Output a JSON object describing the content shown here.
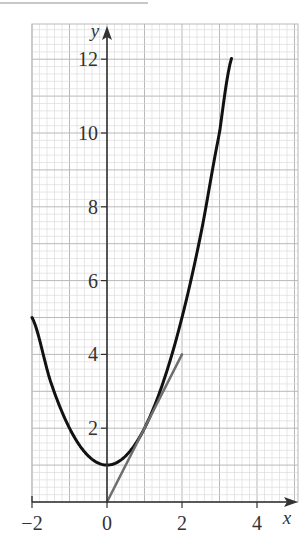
{
  "chart_data": {
    "type": "line",
    "title": "",
    "xlabel": "x",
    "ylabel": "y",
    "xlim": [
      -2,
      5.1
    ],
    "ylim": [
      0,
      12.95
    ],
    "grid": true,
    "grid_minor_step": 0.2,
    "grid_major_step": 1,
    "x_ticks": [
      -2,
      0,
      2,
      4
    ],
    "x_tick_labels": [
      "−2",
      "0",
      "2",
      "4"
    ],
    "y_ticks": [
      2,
      4,
      6,
      8,
      10,
      12
    ],
    "y_tick_labels": [
      "2",
      "4",
      "6",
      "8",
      "10",
      "12"
    ],
    "series": [
      {
        "name": "curve y = x^2 + 1",
        "color": "#111111",
        "width": 3,
        "x": [
          -2,
          -1.5,
          -1,
          -0.5,
          0,
          0.5,
          1,
          1.5,
          2,
          2.5,
          3,
          3.32
        ],
        "y": [
          5,
          3.25,
          2,
          1.25,
          1,
          1.25,
          2,
          3.25,
          5,
          7.25,
          10,
          12.02
        ]
      },
      {
        "name": "tangent line y = 2x (at x = 1)",
        "color": "#6e6e6e",
        "width": 2.5,
        "x": [
          0,
          2
        ],
        "y": [
          0,
          4
        ]
      }
    ]
  },
  "layout": {
    "origin_px": [
      107,
      502
    ],
    "scale_px": [
      37.5,
      36.9
    ],
    "grid_box_px": {
      "left": 32,
      "top": 24,
      "right": 298,
      "bottom": 502
    },
    "colors": {
      "grid_minor": "#dcdcdc",
      "grid_major": "#b9b9b9",
      "axis": "#333333"
    }
  }
}
